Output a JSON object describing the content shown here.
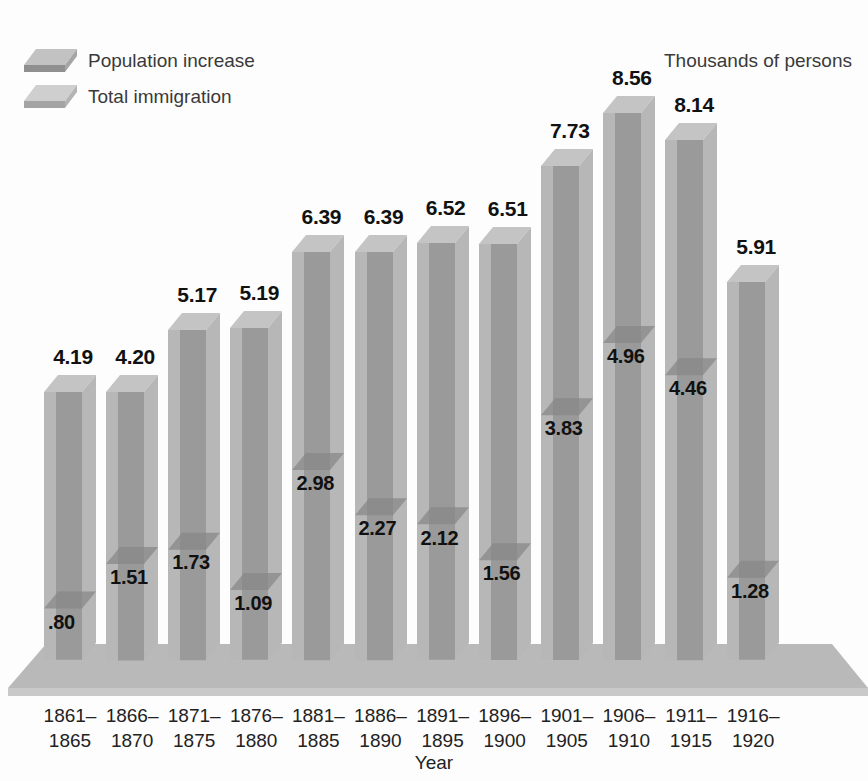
{
  "legend": {
    "items": [
      {
        "label": "Population increase",
        "swatch_top": "#c9c9c9",
        "swatch_side": "#9a9a9a"
      },
      {
        "label": "Total immigration",
        "swatch_top": "#d2d2d2",
        "swatch_side": "#a8a8a8"
      }
    ]
  },
  "units_note": "Thousands of persons",
  "axis_title": "Year",
  "colors": {
    "bar_front": "#9a9a9a",
    "bar_left": "#b7b7b7",
    "bar_top": "#c4c4c4",
    "shelf_top": "#868686",
    "shelf_front": "#8d8d8d",
    "floor_top": "#b9b9b9",
    "floor_front": "#c6c6c6",
    "background": "#fdfdfd",
    "text": "#111111"
  },
  "chart_data": {
    "type": "bar",
    "title": "",
    "subtitle": "",
    "xlabel": "Year",
    "ylabel": "Thousands of persons",
    "ylim": [
      0,
      9.0
    ],
    "grid": false,
    "legend_position": "top-left",
    "categories": [
      "1861-1865",
      "1866-1870",
      "1871-1875",
      "1876-1880",
      "1881-1885",
      "1886-1890",
      "1891-1895",
      "1896-1900",
      "1901-1905",
      "1906-1910",
      "1911-1915",
      "1916-1920"
    ],
    "category_lines": [
      [
        "1861–",
        "1865"
      ],
      [
        "1866–",
        "1870"
      ],
      [
        "1871–",
        "1875"
      ],
      [
        "1876–",
        "1880"
      ],
      [
        "1881–",
        "1885"
      ],
      [
        "1886–",
        "1890"
      ],
      [
        "1891–",
        "1895"
      ],
      [
        "1896–",
        "1900"
      ],
      [
        "1901–",
        "1905"
      ],
      [
        "1906–",
        "1910"
      ],
      [
        "1911–",
        "1915"
      ],
      [
        "1916–",
        "1920"
      ]
    ],
    "series": [
      {
        "name": "Population increase",
        "values": [
          4.19,
          4.2,
          5.17,
          5.19,
          6.39,
          6.39,
          6.52,
          6.51,
          7.73,
          8.56,
          8.14,
          5.91
        ],
        "labels": [
          "4.19",
          "4.20",
          "5.17",
          "5.19",
          "6.39",
          "6.39",
          "6.52",
          "6.51",
          "7.73",
          "8.56",
          "8.14",
          "5.91"
        ]
      },
      {
        "name": "Total immigration",
        "values": [
          0.8,
          1.51,
          1.73,
          1.09,
          2.98,
          2.27,
          2.12,
          1.56,
          3.83,
          4.96,
          4.46,
          1.28
        ],
        "labels": [
          ".80",
          "1.51",
          "1.73",
          "1.09",
          "2.98",
          "2.27",
          "2.12",
          "1.56",
          "3.83",
          "4.96",
          "4.46",
          "1.28"
        ]
      }
    ]
  }
}
